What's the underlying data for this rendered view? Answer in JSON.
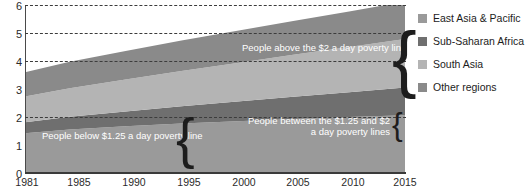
{
  "chart_data": {
    "type": "area",
    "stacked": true,
    "title": "",
    "xlabel": "",
    "ylabel": "",
    "xlim": [
      1981,
      2015
    ],
    "ylim": [
      0,
      6
    ],
    "grid": true,
    "gridlines": [
      2,
      4,
      5,
      6
    ],
    "legend_position": "right",
    "y_ticks": [
      "0",
      "1",
      "2",
      "3",
      "4",
      "5",
      "6"
    ],
    "y_tick_values": [
      0,
      1,
      2,
      3,
      4,
      5,
      6
    ],
    "x_ticks": [
      "1981",
      "1985",
      "1990",
      "1995",
      "2000",
      "2005",
      "2010",
      "2015"
    ],
    "x_tick_values": [
      1981,
      1985,
      1990,
      1995,
      2000,
      2005,
      2010,
      2015
    ],
    "x": [
      1981,
      1985,
      1990,
      1995,
      2000,
      2005,
      2010,
      2015
    ],
    "series": [
      {
        "name": "East Asia & Pacific",
        "color": "#9a9a9a",
        "values": [
          1.42,
          1.55,
          1.67,
          1.77,
          1.85,
          1.93,
          2.0,
          2.06
        ]
      },
      {
        "name": "Sub-Saharan Africa",
        "color": "#6f6f6f",
        "values": [
          0.39,
          0.46,
          0.53,
          0.61,
          0.7,
          0.79,
          0.88,
          0.99
        ]
      },
      {
        "name": "South Asia",
        "color": "#b4b4b4",
        "values": [
          0.92,
          1.02,
          1.14,
          1.26,
          1.38,
          1.5,
          1.62,
          1.74
        ]
      },
      {
        "name": "Other regions",
        "color": "#8a8a8a",
        "values": [
          0.87,
          0.94,
          1.02,
          1.09,
          1.15,
          1.21,
          1.27,
          1.33
        ]
      }
    ],
    "bands": {
      "below_125": {
        "label": "People below $1.25 a day poverty line",
        "values": [
          1.92,
          1.88,
          1.9,
          1.81,
          1.68,
          1.38,
          1.05,
          0.7
        ]
      },
      "between_125_and_2": {
        "label": "People between the $1.25 and $2 a day poverty lines",
        "values": [
          0.95,
          1.0,
          1.04,
          1.05,
          1.05,
          1.02,
          0.97,
          0.9
        ]
      },
      "above_2": {
        "label": "People above the $2 a day poverty line",
        "values": [
          0.73,
          1.09,
          1.42,
          1.87,
          2.35,
          3.03,
          3.75,
          4.52
        ]
      }
    },
    "annotations": [
      {
        "name": "above-2-label",
        "text": "People above the $2 a day poverty line"
      },
      {
        "name": "below-125-label",
        "text": "People below $1.25 a day poverty line"
      },
      {
        "name": "between-label-line1",
        "text": "People between the $1.25 and $2"
      },
      {
        "name": "between-label-line2",
        "text": "a day poverty lines"
      }
    ]
  },
  "legend": {
    "items": [
      {
        "label": "East Asia & Pacific",
        "color": "#9a9a9a"
      },
      {
        "label": "Sub-Saharan Africa",
        "color": "#6f6f6f"
      },
      {
        "label": "South Asia",
        "color": "#b4b4b4"
      },
      {
        "label": "Other regions",
        "color": "#8a8a8a"
      }
    ]
  },
  "axis": {
    "y": {
      "t0": "0",
      "t1": "1",
      "t2": "2",
      "t3": "3",
      "t4": "4",
      "t5": "5",
      "t6": "6"
    },
    "x": {
      "t0": "1981",
      "t1": "1985",
      "t2": "1990",
      "t3": "1995",
      "t4": "2000",
      "t5": "2005",
      "t6": "2010",
      "t7": "2015"
    }
  }
}
